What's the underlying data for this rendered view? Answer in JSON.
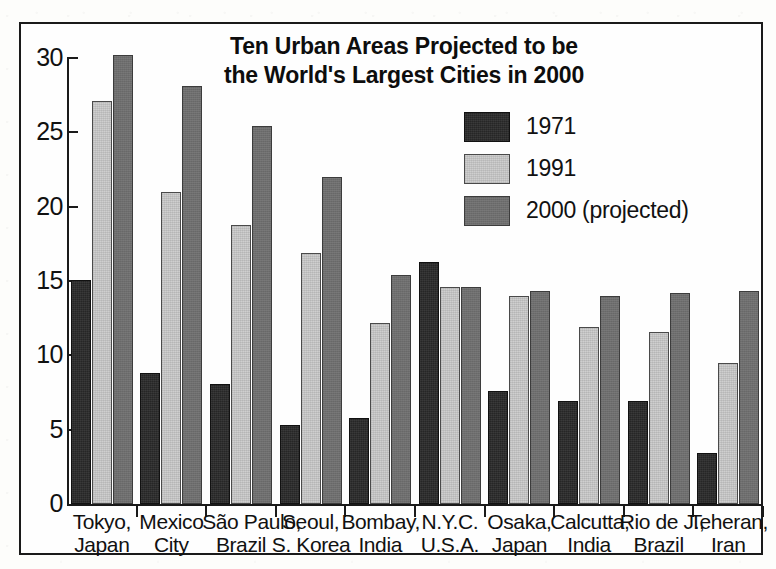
{
  "chart_data": {
    "type": "bar",
    "title": "Ten Urban Areas Projected to be the World's Largest Cities in 2000",
    "title_line1": "Ten Urban Areas Projected to be",
    "title_line2": "the World's Largest Cities in 2000",
    "xlabel": "",
    "ylabel": "",
    "ylim": [
      0,
      30
    ],
    "ytick_labels": [
      "30",
      "25",
      "20",
      "15",
      "10",
      "5",
      "0"
    ],
    "ytick_values": [
      30,
      25,
      20,
      15,
      10,
      5,
      0
    ],
    "grid": false,
    "legend_position": "upper-right-inside",
    "categories": [
      "Tokyo, Japan",
      "Mexico City",
      "São Paulo, Brazil",
      "Seoul, S. Korea",
      "Bombay, India",
      "N.Y.C. U.S.A.",
      "Osaka, Japan",
      "Calcutta, India",
      "Rio de J., Brazil",
      "Teheran, Iran"
    ],
    "category_lines": [
      {
        "line1": "Tokyo,",
        "line2": "Japan"
      },
      {
        "line1": "Mexico",
        "line2": "City"
      },
      {
        "line1": "São Paulo,",
        "line2": "Brazil"
      },
      {
        "line1": "Seoul,",
        "line2": "S. Korea"
      },
      {
        "line1": "Bombay,",
        "line2": "India"
      },
      {
        "line1": "N.Y.C.",
        "line2": "U.S.A."
      },
      {
        "line1": "Osaka,",
        "line2": "Japan"
      },
      {
        "line1": "Calcutta,",
        "line2": "India"
      },
      {
        "line1": "Rio de J.,",
        "line2": "Brazil"
      },
      {
        "line1": "Teheran,",
        "line2": "Iran"
      }
    ],
    "series": [
      {
        "name": "1971",
        "color": "#262626",
        "values": [
          15.1,
          8.8,
          8.1,
          5.3,
          5.8,
          16.3,
          7.6,
          6.9,
          6.9,
          3.4
        ]
      },
      {
        "name": "1991",
        "color": "#cfcfcf",
        "values": [
          27.1,
          21.0,
          18.8,
          16.9,
          12.2,
          14.6,
          14.0,
          11.9,
          11.6,
          9.5
        ]
      },
      {
        "name": "2000 (projected)",
        "color": "#6e6e6e",
        "values": [
          30.2,
          28.1,
          25.4,
          22.0,
          15.4,
          14.6,
          14.3,
          14.0,
          14.2,
          14.3
        ]
      }
    ]
  },
  "legend": {
    "entries": [
      {
        "label": "1971",
        "swatch": "dark-solid-swatch"
      },
      {
        "label": "1991",
        "swatch": "light-gray-swatch"
      },
      {
        "label": "2000 (projected)",
        "swatch": "medium-gray-swatch"
      }
    ]
  }
}
